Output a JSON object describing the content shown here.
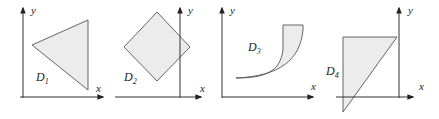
{
  "figure": {
    "axis_labels": {
      "x": "x",
      "y": "y"
    },
    "panels": [
      {
        "id": "D1",
        "label_main": "D",
        "label_sub": "1",
        "shape": "triangle"
      },
      {
        "id": "D2",
        "label_main": "D",
        "label_sub": "2",
        "shape": "square rotated 45°"
      },
      {
        "id": "D3",
        "label_main": "D",
        "label_sub": "3",
        "shape": "region between two curves"
      },
      {
        "id": "D4",
        "label_main": "D",
        "label_sub": "4",
        "shape": "right triangle"
      }
    ]
  },
  "colors": {
    "fill": "#ececec",
    "stroke": "#555555",
    "axis": "#333333"
  }
}
